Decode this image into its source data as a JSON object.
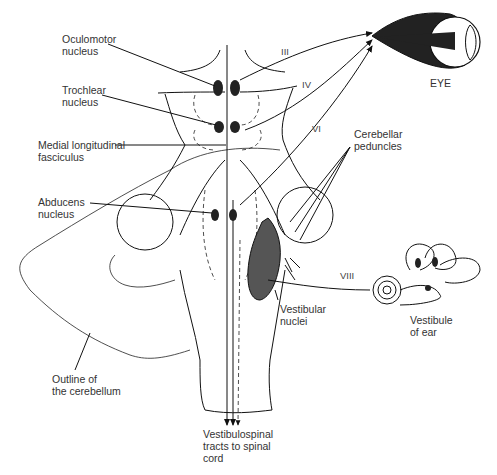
{
  "figure": {
    "labels": {
      "oculomotor": "Oculomotor\nnucleus",
      "trochlear": "Trochlear\nnucleus",
      "mlf": "Medial longitudinal\nfasciculus",
      "abducens": "Abducens\nnucleus",
      "cerebellar_peduncles": "Cerebellar\npeduncles",
      "vestibular_nuclei": "Vestibular\nnuclei",
      "vestibule_of_ear": "Vestibule\nof ear",
      "outline_cerebellum": "Outline of\nthe cerebellum",
      "vestibulospinal": "Vestibulospinal\ntracts to spinal\ncord",
      "eye": "EYE"
    },
    "nerves": {
      "III": "III",
      "IV": "IV",
      "VI": "VI",
      "VIII": "VIII"
    }
  }
}
